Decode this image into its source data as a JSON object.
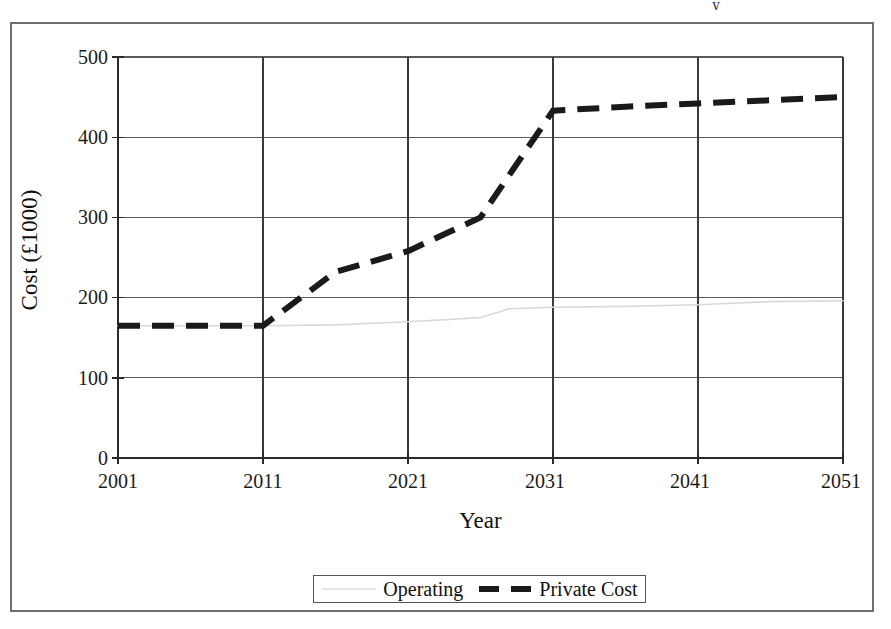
{
  "figure": {
    "y_axis_title": "Cost (£1000)",
    "x_axis_title": "Year",
    "artifact_glyph": "y"
  },
  "legend": {
    "position": "bottom-center",
    "entries": [
      {
        "label": "Operating",
        "style": "thin-solid",
        "color": "#d9d9d9"
      },
      {
        "label": "Private Cost",
        "style": "thick-dashed",
        "color": "#1a1a1a"
      }
    ]
  },
  "axes": {
    "y_ticks": [
      "0",
      "100",
      "200",
      "300",
      "400",
      "500"
    ],
    "x_ticks": [
      "2001",
      "2011",
      "2021",
      "2031",
      "2041",
      "2051"
    ]
  },
  "chart_data": {
    "type": "line",
    "title": "",
    "xlabel": "Year",
    "ylabel": "Cost (£1000)",
    "xlim": [
      2001,
      2051
    ],
    "ylim": [
      0,
      500
    ],
    "yticks": [
      0,
      100,
      200,
      300,
      400,
      500
    ],
    "xticks": [
      2001,
      2011,
      2021,
      2031,
      2041,
      2051
    ],
    "grid": true,
    "legend_position": "bottom-center",
    "series": [
      {
        "name": "Operating",
        "style": "thin-solid",
        "color": "#d9d9d9",
        "x": [
          2001,
          2006,
          2011,
          2016,
          2021,
          2026,
          2028,
          2031,
          2036,
          2041,
          2046,
          2051
        ],
        "values": [
          165,
          165,
          165,
          166,
          170,
          175,
          186,
          188,
          189,
          191,
          195,
          196
        ]
      },
      {
        "name": "Private Cost",
        "style": "thick-dashed",
        "color": "#1a1a1a",
        "x": [
          2001,
          2006,
          2011,
          2016,
          2021,
          2026,
          2031,
          2036,
          2041,
          2046,
          2051
        ],
        "values": [
          165,
          165,
          165,
          232,
          258,
          300,
          433,
          438,
          442,
          446,
          450
        ]
      }
    ]
  }
}
